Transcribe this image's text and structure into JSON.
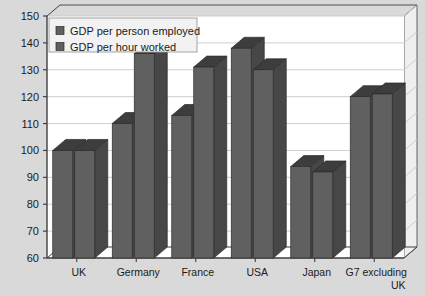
{
  "chart_data": {
    "type": "bar",
    "title": "",
    "xlabel": "",
    "ylabel": "",
    "ylim": [
      60,
      150
    ],
    "ytick_step": 10,
    "yticks": [
      60,
      70,
      80,
      90,
      100,
      110,
      120,
      130,
      140,
      150
    ],
    "grid": true,
    "legend_position": "top-left",
    "style": "3d-column",
    "categories": [
      "UK",
      "Germany",
      "France",
      "USA",
      "Japan",
      "G7 excluding UK"
    ],
    "series": [
      {
        "name": "GDP per person employed",
        "values": [
          100,
          110,
          113,
          138,
          94,
          120
        ],
        "color": "#606060"
      },
      {
        "name": "GDP per hour worked",
        "values": [
          100,
          136,
          131,
          130,
          92,
          121
        ],
        "color": "#606060"
      }
    ]
  },
  "legend": {
    "items": [
      {
        "label": "GDP per person employed",
        "swatch": "#606060"
      },
      {
        "label": "GDP per hour worked",
        "swatch": "#606060"
      }
    ]
  },
  "axis": {
    "y_tick_labels": [
      "150",
      "140",
      "130",
      "120",
      "110",
      "100",
      "90",
      "80",
      "70",
      "60"
    ]
  },
  "category_labels": [
    {
      "line1": "UK",
      "line2": ""
    },
    {
      "line1": "Germany",
      "line2": ""
    },
    {
      "line1": "France",
      "line2": ""
    },
    {
      "line1": "USA",
      "line2": ""
    },
    {
      "line1": "Japan",
      "line2": ""
    },
    {
      "line1": "G7 excluding",
      "line2": "UK"
    }
  ],
  "colors": {
    "page_background": "#d9d9d9",
    "plot_background": "#ffffff",
    "gridline": "#c8c8c8",
    "axis": "#404040",
    "bar_face": "#606060",
    "bar_top": "#3d3d3d",
    "bar_side": "#474747",
    "text": "#1a1a1a",
    "legend_background": "#f2f2f2",
    "legend_border": "#9a9a9a"
  }
}
